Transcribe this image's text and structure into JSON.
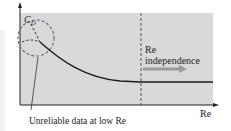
{
  "diagram": {
    "y_axis_label_main": "C",
    "y_axis_label_sub": "D",
    "x_axis_label": "Re",
    "region_label_line1": "Re",
    "region_label_line2": "independence",
    "annotation": "Unreliable data at low Re",
    "colors": {
      "plot_background": "#d9d9d9",
      "curve": "#1a1a1a",
      "dashed": "#555555",
      "arrow": "#9a9a9a",
      "axis": "#222222"
    }
  }
}
